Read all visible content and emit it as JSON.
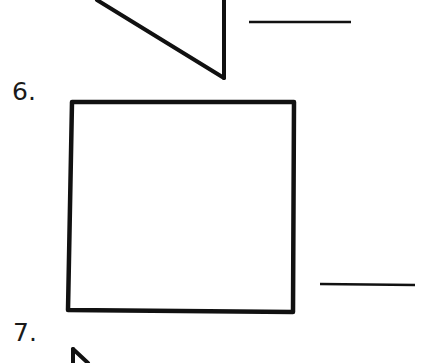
{
  "worksheet": {
    "questions": [
      {
        "number": "6.",
        "shape": "square",
        "answer": ""
      },
      {
        "number": "7.",
        "shape": "partial-triangle",
        "answer": ""
      }
    ],
    "previous_question": {
      "shape": "right-triangle",
      "answer": ""
    }
  },
  "colors": {
    "ink": "#111111",
    "paper": "#ffffff"
  }
}
